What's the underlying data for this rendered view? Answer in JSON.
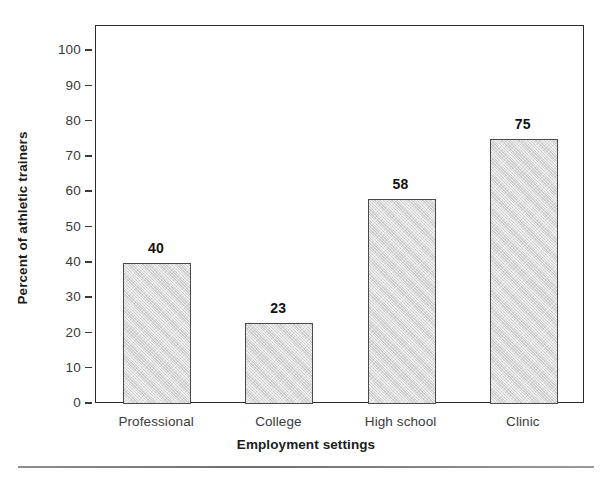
{
  "chart_data": {
    "type": "bar",
    "title": "",
    "subtitle": "",
    "categories": [
      "Professional",
      "College",
      "High school",
      "Clinic"
    ],
    "values": [
      40,
      23,
      58,
      75
    ],
    "data_labels": [
      "40",
      "23",
      "58",
      "75"
    ],
    "xlabel": "Employment settings",
    "ylabel": "Percent of athletic trainers",
    "ylim": [
      0,
      100
    ],
    "yticks": [
      0,
      10,
      20,
      30,
      40,
      50,
      60,
      70,
      80,
      90,
      100
    ],
    "ytick_labels": [
      "0",
      "10",
      "20",
      "30",
      "40",
      "50",
      "60",
      "70",
      "80",
      "90",
      "100"
    ],
    "grid": false,
    "legend": false,
    "legend_position": "none",
    "bar_fill_color": "#d6d6d6",
    "bar_edge_color": "#4a4a4a",
    "axis_color": "#2b2b2b",
    "background_color": "#ffffff"
  }
}
